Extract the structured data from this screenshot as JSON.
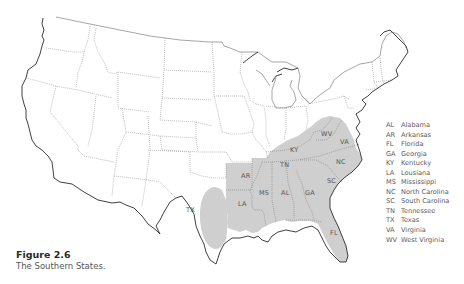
{
  "map": {
    "shade_color": "#cfcfcf",
    "state_labels": [
      {
        "abbr": "AR",
        "x": 241,
        "y": 178
      },
      {
        "abbr": "TX",
        "x": 190,
        "y": 210
      },
      {
        "abbr": "LA",
        "x": 242,
        "y": 206
      },
      {
        "abbr": "MS",
        "x": 264,
        "y": 194
      },
      {
        "abbr": "AL",
        "x": 285,
        "y": 194
      },
      {
        "abbr": "GA",
        "x": 309,
        "y": 194
      },
      {
        "abbr": "TN",
        "x": 284,
        "y": 166
      },
      {
        "abbr": "KY",
        "x": 293,
        "y": 151
      },
      {
        "abbr": "WV",
        "x": 325,
        "y": 135
      },
      {
        "abbr": "VA",
        "x": 343,
        "y": 143
      },
      {
        "abbr": "NC",
        "x": 338,
        "y": 163
      },
      {
        "abbr": "SC",
        "x": 330,
        "y": 182
      },
      {
        "abbr": "FL",
        "x": 333,
        "y": 234
      }
    ]
  },
  "legend": {
    "items": [
      {
        "abbr": "AL",
        "name": "Alabama"
      },
      {
        "abbr": "AR",
        "name": "Arkansas"
      },
      {
        "abbr": "FL",
        "name": "Florida"
      },
      {
        "abbr": "GA",
        "name": "Georgia"
      },
      {
        "abbr": "KY",
        "name": "Kentucky"
      },
      {
        "abbr": "LA",
        "name": "Lousiana"
      },
      {
        "abbr": "MS",
        "name": "Mississippi"
      },
      {
        "abbr": "NC",
        "name": "North Carolina"
      },
      {
        "abbr": "SC",
        "name": "South Carolina"
      },
      {
        "abbr": "TN",
        "name": "Tennessee"
      },
      {
        "abbr": "TX",
        "name": "Texas"
      },
      {
        "abbr": "VA",
        "name": "Virginia"
      },
      {
        "abbr": "WV",
        "name": "West Virginia"
      }
    ]
  },
  "caption": {
    "title": "Figure 2.6",
    "text": "The Southern States."
  }
}
